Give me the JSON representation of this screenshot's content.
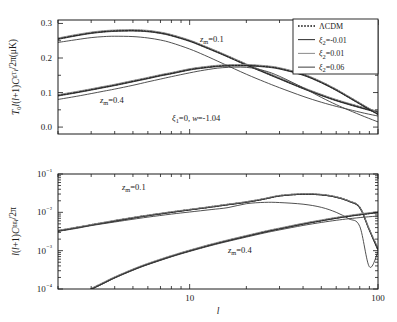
{
  "figure": {
    "background": "#ffffff",
    "ink": "#1a1a1a",
    "width": 397,
    "height": 322
  },
  "legend": {
    "position": "top-right-of-upper-panel",
    "box": {
      "x": 293,
      "y": 19,
      "w": 85,
      "h": 55
    },
    "entries": [
      {
        "label": "ΛCDM",
        "style": "dotted",
        "color": "#111111"
      },
      {
        "label": "ξ₂=-0.01",
        "style": "solid",
        "color": "#2b2b2b"
      },
      {
        "label": "ξ₂=0.01",
        "style": "solid",
        "color": "#8a8a8a"
      },
      {
        "label": "ξ₂=0.06",
        "style": "solid",
        "color": "#3d3d3d"
      }
    ]
  },
  "annotations": {
    "top_zm01": "z_m=0.1",
    "top_zm04": "z_m=0.4",
    "params": "ξ₁=0, w=-1.04",
    "bottom_zm01": "z_m=0.1",
    "bottom_zm04": "z_m=0.4"
  },
  "chart_data": [
    {
      "type": "line",
      "panel": "upper",
      "title": "",
      "xlabel": "l",
      "ylabel": "T₀l(l+1)Cₗ^{gT}/2π(μK)",
      "xscale": "log",
      "yscale": "linear",
      "xlim": [
        2,
        100
      ],
      "ylim": [
        -0.02,
        0.31
      ],
      "xticks_labeled": [
        10,
        100
      ],
      "yticks": [
        0.0,
        0.1,
        0.2,
        0.3
      ],
      "ytick_labels": [
        "0.0",
        "0.1",
        "0.2",
        "0.3"
      ],
      "grid": false,
      "series": [
        {
          "name": "ΛCDM z_m=0.1",
          "group": "z_m=0.1",
          "style": "dotted",
          "color": "#111111",
          "x": [
            2,
            2.5,
            3,
            3.5,
            4,
            5,
            6,
            7,
            8,
            10,
            12,
            15,
            20,
            25,
            30,
            40,
            50,
            60,
            70,
            85,
            100
          ],
          "y": [
            0.256,
            0.266,
            0.273,
            0.277,
            0.279,
            0.28,
            0.278,
            0.273,
            0.266,
            0.25,
            0.233,
            0.211,
            0.181,
            0.159,
            0.141,
            0.113,
            0.093,
            0.078,
            0.067,
            0.054,
            0.044
          ]
        },
        {
          "name": "ξ₂=-0.01 z_m=0.1",
          "group": "z_m=0.1",
          "style": "solid",
          "color": "#2b2b2b",
          "x": [
            2,
            2.5,
            3,
            3.5,
            4,
            5,
            6,
            7,
            8,
            10,
            12,
            15,
            20,
            25,
            30,
            40,
            50,
            60,
            70,
            85,
            100
          ],
          "y": [
            0.254,
            0.264,
            0.271,
            0.275,
            0.277,
            0.278,
            0.276,
            0.271,
            0.264,
            0.248,
            0.231,
            0.209,
            0.179,
            0.157,
            0.139,
            0.111,
            0.091,
            0.076,
            0.065,
            0.052,
            0.042
          ]
        },
        {
          "name": "ξ₂=0.01 z_m=0.1",
          "group": "z_m=0.1",
          "style": "solid",
          "color": "#8a8a8a",
          "x": [
            2,
            2.5,
            3,
            3.5,
            4,
            5,
            6,
            7,
            8,
            10,
            12,
            15,
            20,
            25,
            30,
            40,
            50,
            60,
            70,
            85,
            100
          ],
          "y": [
            0.258,
            0.268,
            0.275,
            0.279,
            0.281,
            0.282,
            0.28,
            0.275,
            0.268,
            0.252,
            0.235,
            0.213,
            0.183,
            0.161,
            0.143,
            0.115,
            0.095,
            0.08,
            0.069,
            0.056,
            0.046
          ]
        },
        {
          "name": "ξ₂=0.06 z_m=0.1",
          "group": "z_m=0.1",
          "style": "solid",
          "color": "#3d3d3d",
          "x": [
            2,
            2.5,
            3,
            3.5,
            4,
            5,
            6,
            7,
            8,
            10,
            12,
            15,
            20,
            25,
            30,
            40,
            50,
            60,
            70,
            85,
            100
          ],
          "y": [
            0.245,
            0.253,
            0.259,
            0.262,
            0.263,
            0.262,
            0.258,
            0.252,
            0.244,
            0.226,
            0.208,
            0.184,
            0.153,
            0.131,
            0.114,
            0.089,
            0.072,
            0.06,
            0.051,
            0.04,
            0.032
          ]
        },
        {
          "name": "ΛCDM z_m=0.4",
          "group": "z_m=0.4",
          "style": "dotted",
          "color": "#111111",
          "x": [
            2,
            2.5,
            3,
            3.5,
            4,
            5,
            6,
            7,
            8,
            10,
            12,
            15,
            20,
            25,
            30,
            40,
            50,
            60,
            70,
            85,
            100
          ],
          "y": [
            0.092,
            0.101,
            0.109,
            0.116,
            0.122,
            0.133,
            0.142,
            0.15,
            0.156,
            0.167,
            0.173,
            0.178,
            0.179,
            0.176,
            0.17,
            0.152,
            0.13,
            0.108,
            0.087,
            0.06,
            0.038
          ]
        },
        {
          "name": "ξ₂=-0.01 z_m=0.4",
          "group": "z_m=0.4",
          "style": "solid",
          "color": "#2b2b2b",
          "x": [
            2,
            2.5,
            3,
            3.5,
            4,
            5,
            6,
            7,
            8,
            10,
            12,
            15,
            20,
            25,
            30,
            40,
            50,
            60,
            70,
            85,
            100
          ],
          "y": [
            0.09,
            0.099,
            0.107,
            0.114,
            0.12,
            0.131,
            0.14,
            0.148,
            0.154,
            0.165,
            0.171,
            0.176,
            0.177,
            0.174,
            0.168,
            0.15,
            0.128,
            0.106,
            0.085,
            0.058,
            0.036
          ]
        },
        {
          "name": "ξ₂=0.01 z_m=0.4",
          "group": "z_m=0.4",
          "style": "solid",
          "color": "#8a8a8a",
          "x": [
            2,
            2.5,
            3,
            3.5,
            4,
            5,
            6,
            7,
            8,
            10,
            12,
            15,
            20,
            25,
            30,
            40,
            50,
            60,
            70,
            85,
            100
          ],
          "y": [
            0.094,
            0.103,
            0.111,
            0.118,
            0.124,
            0.135,
            0.144,
            0.152,
            0.158,
            0.169,
            0.175,
            0.18,
            0.181,
            0.178,
            0.172,
            0.154,
            0.132,
            0.11,
            0.089,
            0.062,
            0.04
          ]
        },
        {
          "name": "ξ₂=0.06 z_m=0.4",
          "group": "z_m=0.4",
          "style": "solid",
          "color": "#3d3d3d",
          "x": [
            2,
            2.5,
            3,
            3.5,
            4,
            5,
            6,
            7,
            8,
            10,
            12,
            15,
            20,
            25,
            30,
            40,
            50,
            60,
            70,
            85,
            100
          ],
          "y": [
            0.08,
            0.089,
            0.097,
            0.104,
            0.11,
            0.121,
            0.131,
            0.139,
            0.146,
            0.157,
            0.165,
            0.172,
            0.173,
            0.163,
            0.147,
            0.114,
            0.086,
            0.065,
            0.049,
            0.03,
            0.015
          ]
        }
      ]
    },
    {
      "type": "line",
      "panel": "lower",
      "title": "",
      "xlabel": "l",
      "ylabel": "l(l+1)Cₗ^{gg}/2π",
      "xscale": "log",
      "yscale": "log",
      "xlim": [
        2,
        100
      ],
      "ylim": [
        0.0001,
        0.1
      ],
      "xticks_labeled": [
        10,
        100
      ],
      "yticks": [
        0.0001,
        0.001,
        0.01,
        0.1
      ],
      "ytick_labels": [
        "10⁻⁴",
        "10⁻³",
        "10⁻²",
        "10⁻¹"
      ],
      "grid": false,
      "series": [
        {
          "name": "ΛCDM z_m=0.1",
          "group": "z_m=0.1",
          "style": "dotted",
          "color": "#111111",
          "x": [
            2,
            2.5,
            3,
            4,
            5,
            6,
            8,
            10,
            13,
            16,
            20,
            25,
            30,
            40,
            50,
            60,
            70,
            80,
            90,
            100
          ],
          "y": [
            0.0033,
            0.004,
            0.0047,
            0.006,
            0.0072,
            0.0083,
            0.0101,
            0.0117,
            0.0139,
            0.016,
            0.0185,
            0.0225,
            0.027,
            0.03,
            0.0288,
            0.025,
            0.0196,
            0.0134,
            0.0035,
            0.0011
          ]
        },
        {
          "name": "ξ₂=-0.01 z_m=0.1",
          "group": "z_m=0.1",
          "style": "solid",
          "color": "#2b2b2b",
          "x": [
            2,
            2.5,
            3,
            4,
            5,
            6,
            8,
            10,
            13,
            16,
            20,
            25,
            30,
            40,
            50,
            60,
            70,
            80,
            90,
            100
          ],
          "y": [
            0.0032,
            0.0039,
            0.0046,
            0.0058,
            0.007,
            0.0081,
            0.0099,
            0.0115,
            0.0136,
            0.0157,
            0.0182,
            0.0221,
            0.0266,
            0.0296,
            0.0284,
            0.0247,
            0.0193,
            0.0131,
            0.0034,
            0.001
          ]
        },
        {
          "name": "ξ₂=0.01 z_m=0.1",
          "group": "z_m=0.1",
          "style": "solid",
          "color": "#8a8a8a",
          "x": [
            2,
            2.5,
            3,
            4,
            5,
            6,
            8,
            10,
            13,
            16,
            20,
            25,
            30,
            40,
            50,
            60,
            70,
            80,
            90,
            100
          ],
          "y": [
            0.0034,
            0.0041,
            0.0048,
            0.0062,
            0.0074,
            0.0085,
            0.0104,
            0.012,
            0.0142,
            0.0164,
            0.019,
            0.0231,
            0.0277,
            0.0308,
            0.0295,
            0.0256,
            0.02,
            0.0137,
            0.0036,
            0.0012
          ]
        },
        {
          "name": "ξ₂=0.06 z_m=0.1",
          "group": "z_m=0.1",
          "style": "solid",
          "color": "#3d3d3d",
          "x": [
            2,
            2.5,
            3,
            4,
            5,
            6,
            8,
            10,
            13,
            16,
            20,
            25,
            30,
            40,
            50,
            60,
            70,
            80,
            90,
            100
          ],
          "y": [
            0.0032,
            0.0038,
            0.0045,
            0.0056,
            0.0066,
            0.0075,
            0.009,
            0.0102,
            0.0118,
            0.0133,
            0.0168,
            0.0182,
            0.018,
            0.0163,
            0.0135,
            0.01,
            0.0068,
            0.0043,
            0.00038,
            0.00095
          ]
        },
        {
          "name": "ΛCDM z_m=0.4",
          "group": "z_m=0.4",
          "style": "dotted",
          "color": "#111111",
          "x": [
            3,
            3.5,
            4,
            5,
            6,
            8,
            10,
            13,
            16,
            20,
            25,
            30,
            40,
            50,
            60,
            70,
            85,
            100
          ],
          "y": [
            0.0001,
            0.000145,
            0.0002,
            0.00032,
            0.00045,
            0.00072,
            0.001,
            0.00143,
            0.00185,
            0.0024,
            0.0031,
            0.00375,
            0.005,
            0.0061,
            0.0071,
            0.008,
            0.0091,
            0.01
          ]
        },
        {
          "name": "ξ₂=-0.01 z_m=0.4",
          "group": "z_m=0.4",
          "style": "solid",
          "color": "#2b2b2b",
          "x": [
            3,
            3.5,
            4,
            5,
            6,
            8,
            10,
            13,
            16,
            20,
            25,
            30,
            40,
            50,
            60,
            70,
            85,
            100
          ],
          "y": [
            9.8e-05,
            0.000142,
            0.000196,
            0.000313,
            0.00044,
            0.000705,
            0.00098,
            0.0014,
            0.00181,
            0.00235,
            0.00304,
            0.00368,
            0.0049,
            0.00598,
            0.00696,
            0.00784,
            0.00892,
            0.0098
          ]
        },
        {
          "name": "ξ₂=0.01 z_m=0.4",
          "group": "z_m=0.4",
          "style": "solid",
          "color": "#8a8a8a",
          "x": [
            3,
            3.5,
            4,
            5,
            6,
            8,
            10,
            13,
            16,
            20,
            25,
            30,
            40,
            50,
            60,
            70,
            85,
            100
          ],
          "y": [
            0.000104,
            0.000151,
            0.000208,
            0.000333,
            0.000468,
            0.000749,
            0.00104,
            0.00149,
            0.001925,
            0.0025,
            0.00323,
            0.0039,
            0.0052,
            0.00635,
            0.0074,
            0.00833,
            0.00948,
            0.0104
          ]
        },
        {
          "name": "ξ₂=0.06 z_m=0.4",
          "group": "z_m=0.4",
          "style": "solid",
          "color": "#3d3d3d",
          "x": [
            3,
            3.5,
            4,
            5,
            6,
            8,
            10,
            13,
            16,
            20,
            25,
            30,
            40,
            50,
            60,
            70,
            85,
            100
          ],
          "y": [
            9.7e-05,
            0.00014,
            0.000193,
            0.000308,
            0.000432,
            0.00069,
            0.000955,
            0.00136,
            0.00175,
            0.00226,
            0.0029,
            0.00348,
            0.00455,
            0.00545,
            0.0062,
            0.0068,
            0.0075,
            0.008
          ]
        }
      ]
    }
  ]
}
